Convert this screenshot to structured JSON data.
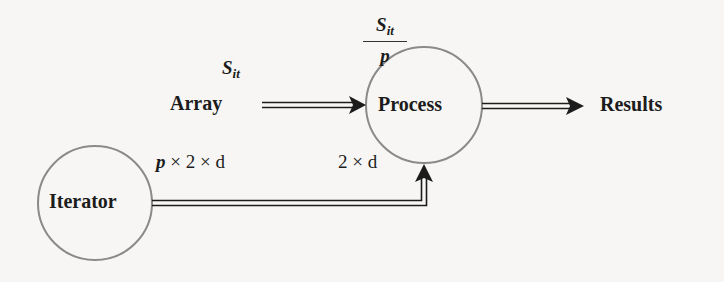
{
  "diagram": {
    "nodes": {
      "array": {
        "label": "Array"
      },
      "process": {
        "label": "Process"
      },
      "results": {
        "label": "Results"
      },
      "iterator": {
        "label": "Iterator"
      }
    },
    "edges": {
      "array_to_process": {
        "label_main": "S",
        "label_sub": "it"
      },
      "process_input_fraction": {
        "numerator_main": "S",
        "numerator_sub": "it",
        "denominator": "p"
      },
      "iterator_out": {
        "label_p": "p",
        "label_rest": " × 2 × d"
      },
      "process_in_from_iterator": {
        "label": "2 × d"
      },
      "process_to_results": {}
    },
    "colors": {
      "background": "#f7f6f4",
      "circle_stroke": "#8a8a8a",
      "arrow": "#1c1c1c",
      "text": "#1c1c1c"
    }
  }
}
